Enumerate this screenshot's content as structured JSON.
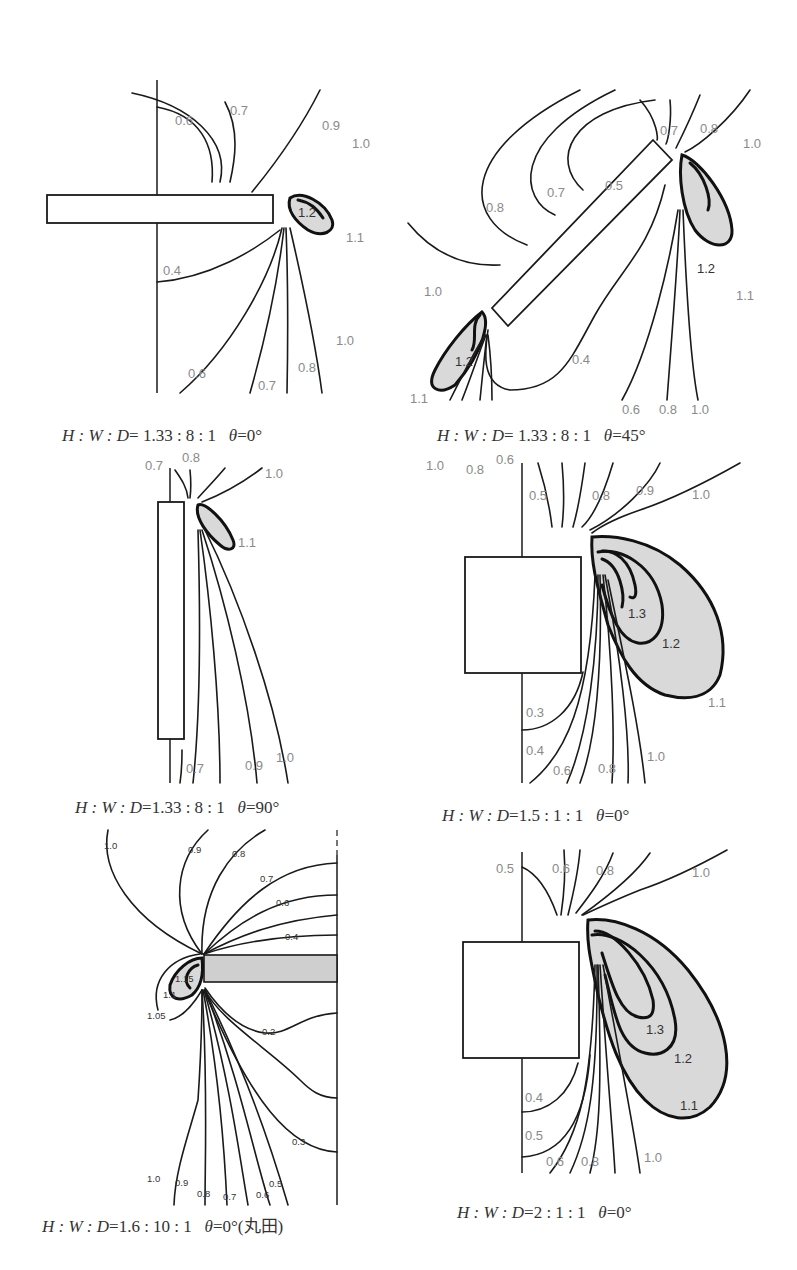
{
  "panels": [
    {
      "id": "p1",
      "caption": {
        "ratio_label": "H : W : D",
        "ratio": "= 1.33 : 8 : 1",
        "angle_label": "θ",
        "angle": "=0°"
      },
      "contour_labels": [
        "0.6",
        "0.7",
        "0.9",
        "1.0",
        "1.2",
        "1.1",
        "0.4",
        "1.0",
        "0.6",
        "0.7",
        "0.8"
      ]
    },
    {
      "id": "p2",
      "caption": {
        "ratio_label": "H : W : D",
        "ratio": "= 1.33 : 8 : 1",
        "angle_label": "θ",
        "angle": "=45°"
      },
      "contour_labels": [
        "0.7",
        "0.8",
        "1.0",
        "0.8",
        "0.7",
        "0.5",
        "1.2",
        "1.1",
        "1.0",
        "1.2",
        "1.1",
        "0.4",
        "0.6",
        "0.8",
        "1.0",
        "1.0",
        "0.8",
        "0.6"
      ]
    },
    {
      "id": "p3",
      "caption": {
        "ratio_label": "H : W : D",
        "ratio": "=1.33 : 8 : 1",
        "angle_label": "θ",
        "angle": "=90°"
      },
      "contour_labels": [
        "0.7",
        "0.8",
        "1.0",
        "1.1",
        "0.7",
        "0.9",
        "1.0"
      ]
    },
    {
      "id": "p4",
      "caption": {
        "ratio_label": "H : W : D",
        "ratio": "=1.5 : 1 : 1",
        "angle_label": "θ",
        "angle": "=0°"
      },
      "contour_labels": [
        "0.5",
        "0.8",
        "0.9",
        "1.0",
        "1.3",
        "1.2",
        "1.1",
        "0.3",
        "0.4",
        "0.6",
        "0.8",
        "1.0"
      ]
    },
    {
      "id": "p5",
      "caption": {
        "ratio_label": "H : W : D",
        "ratio": "=1.6 : 10 : 1",
        "angle_label": "θ",
        "angle": "=0°(丸田)"
      },
      "contour_labels": [
        "1.0",
        "0.9",
        "0.8",
        "0.7",
        "0.6",
        "0.4",
        "1.15",
        "1.1",
        "1.05",
        "0.2",
        "0.3",
        "1.0",
        "0.9",
        "0.8",
        "0.7",
        "0.6",
        "0.5"
      ]
    },
    {
      "id": "p6",
      "caption": {
        "ratio_label": "H : W : D",
        "ratio": "=2 : 1 : 1",
        "angle_label": "θ",
        "angle": "=0°"
      },
      "contour_labels": [
        "0.5",
        "0.6",
        "0.8",
        "1.0",
        "1.3",
        "1.2",
        "1.1",
        "0.4",
        "0.5",
        "0.6",
        "0.8",
        "1.0"
      ]
    }
  ],
  "colors": {
    "shaded_region": "#d9d9d9",
    "line": "#1a1a1a",
    "label": "#8a8a8a"
  }
}
